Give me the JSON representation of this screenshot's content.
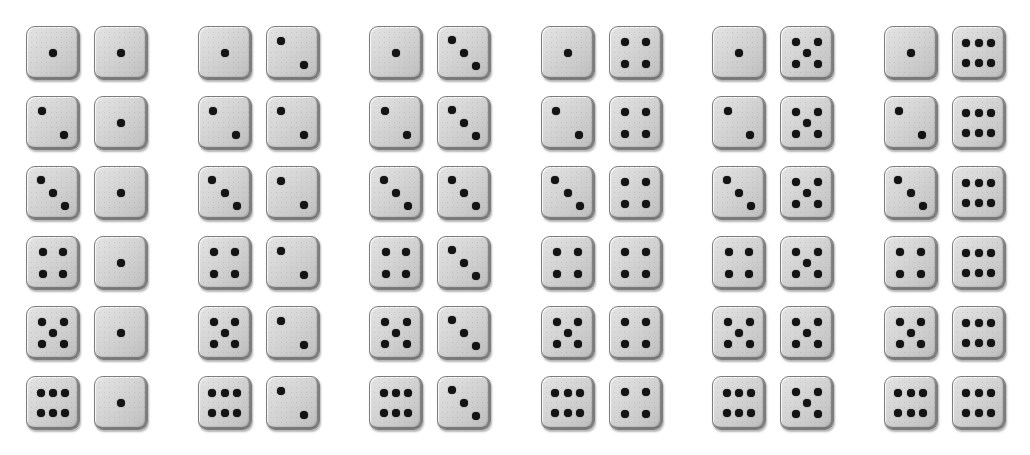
{
  "page": {
    "background_color": "#ffffff",
    "width": 1030,
    "height": 455
  },
  "die_style": {
    "body_color": "#d6d6d6",
    "edge_color": "#7c7c7c",
    "pip_color": "#141414",
    "size_px": 54,
    "corner_radius_px": 9,
    "pip_diameter_px": 8
  },
  "layout": {
    "group_count": 6,
    "row_count": 6,
    "dice_per_pair": 2,
    "total_dice": 72,
    "total_outcomes": 36,
    "first_group_left_x": 26,
    "group_pitch_x": 171.5,
    "pair_gap_x": 68,
    "first_row_y": 26,
    "row_pitch_y": 70
  },
  "pip_layouts": {
    "1": [
      [
        50,
        50
      ]
    ],
    "2": [
      [
        28,
        26
      ],
      [
        72,
        74
      ]
    ],
    "3": [
      [
        26,
        25
      ],
      [
        50,
        50
      ],
      [
        74,
        75
      ]
    ],
    "4": [
      [
        30,
        29
      ],
      [
        70,
        29
      ],
      [
        30,
        71
      ],
      [
        70,
        71
      ]
    ],
    "5": [
      [
        29,
        28
      ],
      [
        71,
        28
      ],
      [
        50,
        50
      ],
      [
        29,
        72
      ],
      [
        71,
        72
      ]
    ],
    "6": [
      [
        26,
        31
      ],
      [
        50,
        31
      ],
      [
        74,
        31
      ],
      [
        26,
        69
      ],
      [
        50,
        69
      ],
      [
        74,
        69
      ]
    ]
  },
  "groups": [
    {
      "index": 1,
      "right_die_value": 1,
      "pairs": [
        {
          "row": 1,
          "left": 1,
          "right": 1,
          "sum": 2
        },
        {
          "row": 2,
          "left": 2,
          "right": 1,
          "sum": 3
        },
        {
          "row": 3,
          "left": 3,
          "right": 1,
          "sum": 4
        },
        {
          "row": 4,
          "left": 4,
          "right": 1,
          "sum": 5
        },
        {
          "row": 5,
          "left": 5,
          "right": 1,
          "sum": 6
        },
        {
          "row": 6,
          "left": 6,
          "right": 1,
          "sum": 7
        }
      ]
    },
    {
      "index": 2,
      "right_die_value": 2,
      "pairs": [
        {
          "row": 1,
          "left": 1,
          "right": 2,
          "sum": 3
        },
        {
          "row": 2,
          "left": 2,
          "right": 2,
          "sum": 4
        },
        {
          "row": 3,
          "left": 3,
          "right": 2,
          "sum": 5
        },
        {
          "row": 4,
          "left": 4,
          "right": 2,
          "sum": 6
        },
        {
          "row": 5,
          "left": 5,
          "right": 2,
          "sum": 7
        },
        {
          "row": 6,
          "left": 6,
          "right": 2,
          "sum": 8
        }
      ]
    },
    {
      "index": 3,
      "right_die_value": 3,
      "pairs": [
        {
          "row": 1,
          "left": 1,
          "right": 3,
          "sum": 4
        },
        {
          "row": 2,
          "left": 2,
          "right": 3,
          "sum": 5
        },
        {
          "row": 3,
          "left": 3,
          "right": 3,
          "sum": 6
        },
        {
          "row": 4,
          "left": 4,
          "right": 3,
          "sum": 7
        },
        {
          "row": 5,
          "left": 5,
          "right": 3,
          "sum": 8
        },
        {
          "row": 6,
          "left": 6,
          "right": 3,
          "sum": 9
        }
      ]
    },
    {
      "index": 4,
      "right_die_value": 4,
      "pairs": [
        {
          "row": 1,
          "left": 1,
          "right": 4,
          "sum": 5
        },
        {
          "row": 2,
          "left": 2,
          "right": 4,
          "sum": 6
        },
        {
          "row": 3,
          "left": 3,
          "right": 4,
          "sum": 7
        },
        {
          "row": 4,
          "left": 4,
          "right": 4,
          "sum": 8
        },
        {
          "row": 5,
          "left": 5,
          "right": 4,
          "sum": 9
        },
        {
          "row": 6,
          "left": 6,
          "right": 4,
          "sum": 10
        }
      ]
    },
    {
      "index": 5,
      "right_die_value": 5,
      "pairs": [
        {
          "row": 1,
          "left": 1,
          "right": 5,
          "sum": 6
        },
        {
          "row": 2,
          "left": 2,
          "right": 5,
          "sum": 7
        },
        {
          "row": 3,
          "left": 3,
          "right": 5,
          "sum": 8
        },
        {
          "row": 4,
          "left": 4,
          "right": 5,
          "sum": 9
        },
        {
          "row": 5,
          "left": 5,
          "right": 5,
          "sum": 10
        },
        {
          "row": 6,
          "left": 6,
          "right": 5,
          "sum": 11
        }
      ]
    },
    {
      "index": 6,
      "right_die_value": 6,
      "pairs": [
        {
          "row": 1,
          "left": 1,
          "right": 6,
          "sum": 7
        },
        {
          "row": 2,
          "left": 2,
          "right": 6,
          "sum": 8
        },
        {
          "row": 3,
          "left": 3,
          "right": 6,
          "sum": 9
        },
        {
          "row": 4,
          "left": 4,
          "right": 6,
          "sum": 10
        },
        {
          "row": 5,
          "left": 5,
          "right": 6,
          "sum": 11
        },
        {
          "row": 6,
          "left": 6,
          "right": 6,
          "sum": 12
        }
      ]
    }
  ]
}
